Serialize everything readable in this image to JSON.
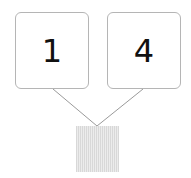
{
  "diagram": {
    "boxes": [
      {
        "label": "1"
      },
      {
        "label": "4"
      }
    ],
    "colors": {
      "box_border": "#b5b5b5",
      "line": "#9a9a9a",
      "square_fill": "#e0e0e0"
    }
  }
}
